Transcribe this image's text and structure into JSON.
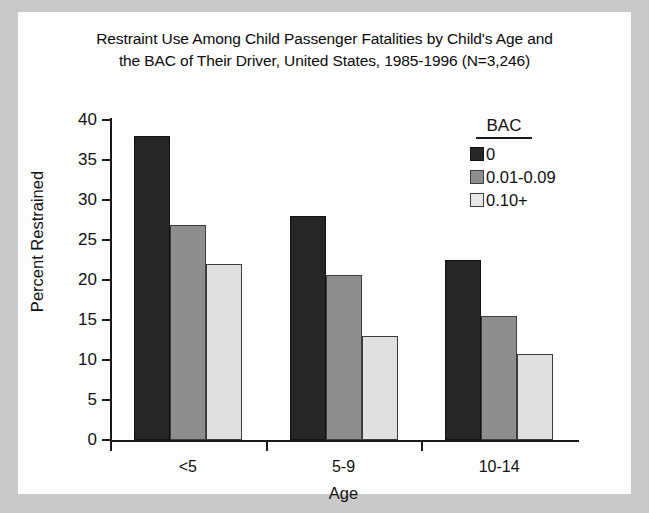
{
  "chart_data": {
    "type": "bar",
    "title": "Restraint Use Among Child Passenger Fatalities by Child's Age and the BAC of Their Driver, United States, 1985-1996 (N=3,246)",
    "title_lines": [
      "Restraint Use Among Child Passenger Fatalities by Child's Age and",
      "the BAC of Their Driver, United States, 1985-1996 (N=3,246)"
    ],
    "xlabel": "Age",
    "ylabel": "Percent Restrained",
    "categories": [
      "<5",
      "5-9",
      "10-14"
    ],
    "ylim": [
      0,
      40
    ],
    "yticks": [
      0,
      5,
      10,
      15,
      20,
      25,
      30,
      35,
      40
    ],
    "ytick_labels": [
      "0",
      "5",
      "10",
      "15",
      "20",
      "25",
      "30",
      "35",
      "40"
    ],
    "grid": false,
    "legend_title": "BAC",
    "legend_position": "top-right-inside",
    "series": [
      {
        "name": "0",
        "color": "#262626",
        "values": [
          38.0,
          28.0,
          22.5
        ]
      },
      {
        "name": "0.01-0.09",
        "color": "#8e8e8e",
        "values": [
          26.9,
          20.6,
          15.5
        ]
      },
      {
        "name": "0.10+",
        "color": "#e0e0e0",
        "values": [
          22.0,
          13.0,
          10.7
        ]
      }
    ]
  }
}
